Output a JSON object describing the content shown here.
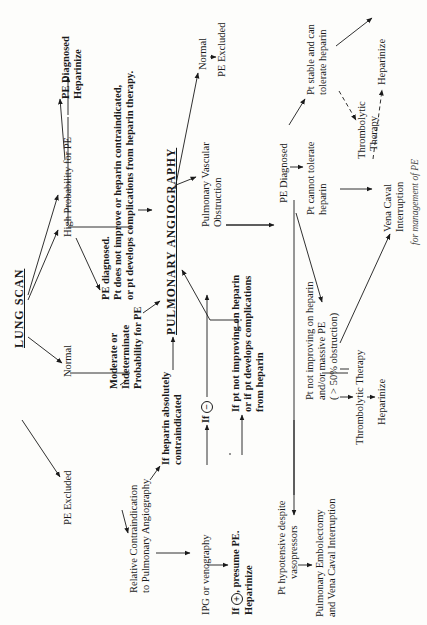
{
  "diagram": {
    "title": "LUNG SCAN",
    "caption": "for management of PE",
    "nodes": {
      "lung_scan": "LUNG SCAN",
      "normal_scan": "Normal",
      "pe_excluded_1": "PE Excluded",
      "moderate": [
        "Moderate or",
        "Indeterminate",
        "Probability for PE"
      ],
      "high_prob": "High Probability for PE",
      "pe_diag_heparinize": [
        "PE Diagnosed",
        "Heparinize"
      ],
      "pe_diag_notimprove": [
        "PE diagnosed.",
        "Pt does not improve or heparin contraindicated,",
        "or pt develops complications from heparin therapy."
      ],
      "pulm_angiography": "PULMONARY ANGIOGRAPHY",
      "rel_contra": [
        "Relative Contraindication",
        "to Pulmonary Angiography"
      ],
      "heparin_abs": [
        "If heparin absolutely",
        "contraindicated"
      ],
      "ipg": "IPG or venography",
      "if_negative": "If",
      "negative_sign": "−",
      "if_positive_prefix": "If",
      "positive_sign": "+",
      "if_positive_rest": ", presume PE.",
      "heparinize_1": "Heparinize",
      "not_improving_hep": [
        "If  pt not improving on heparin",
        "or if pt develops complications",
        "from heparin"
      ],
      "normal_angio": "Normal",
      "pe_excluded_2": "PE Excluded",
      "pulm_vasc_obs": [
        "Pulmonary Vascular",
        "Obstruction"
      ],
      "pe_diagnosed": "PE Diagnosed",
      "pt_stable": [
        "Pt stable and can",
        "tolerate heparin"
      ],
      "heparinize_2": "Heparinize",
      "thrombolytic_1": [
        "Thrombolytic",
        "Therapy"
      ],
      "pt_cannot": [
        "Pt cannot tolerate",
        "heparin"
      ],
      "vena_caval": [
        "Vena Caval",
        "Interruption"
      ],
      "pt_not_improving": [
        "Pt not improving on  heparin",
        "and/or massive PE",
        "( > 50% obstruction)"
      ],
      "thrombolytic_2": "Thrombolytic  Therapy",
      "heparinize_3": "Heparinize",
      "pt_hypotensive": [
        "Pt hypotensive despite",
        "vasopressors"
      ],
      "embolectomy": [
        "Pulmonary Embolectomy",
        "and Vena Caval Interruption"
      ]
    },
    "edges": [
      {
        "from": "lung_scan",
        "to": "normal_scan"
      },
      {
        "from": "normal_scan",
        "to": "pe_excluded_1"
      },
      {
        "from": "lung_scan",
        "to": "moderate"
      },
      {
        "from": "lung_scan",
        "to": "high_prob"
      },
      {
        "from": "high_prob",
        "to": "pe_diag_heparinize"
      },
      {
        "from": "high_prob",
        "to": "pe_diag_notimprove"
      },
      {
        "from": "pe_diag_notimprove",
        "to": "pulm_angiography"
      },
      {
        "from": "moderate",
        "to": "pulm_angiography"
      },
      {
        "from": "moderate",
        "to": "rel_contra"
      },
      {
        "from": "rel_contra",
        "to": "heparin_abs"
      },
      {
        "from": "heparin_abs",
        "to": "pulm_angiography"
      },
      {
        "from": "rel_contra",
        "to": "ipg"
      },
      {
        "from": "ipg",
        "to": "if_negative"
      },
      {
        "from": "if_negative",
        "to": "pulm_angiography"
      },
      {
        "from": "ipg",
        "to": "if_positive"
      },
      {
        "from": "if_positive",
        "to": "not_improving_hep"
      },
      {
        "from": "not_improving_hep",
        "to": "pulm_angiography"
      },
      {
        "from": "pulm_angiography",
        "to": "normal_angio"
      },
      {
        "from": "normal_angio",
        "to": "pe_excluded_2"
      },
      {
        "from": "pulm_angiography",
        "to": "pulm_vasc_obs"
      },
      {
        "from": "pulm_vasc_obs",
        "to": "pe_diagnosed"
      },
      {
        "from": "pe_diagnosed",
        "to": "pt_stable"
      },
      {
        "from": "pt_stable",
        "to": "heparinize_2"
      },
      {
        "from": "pt_stable",
        "to": "thrombolytic_1",
        "style": "dashed"
      },
      {
        "from": "thrombolytic_1",
        "to": "heparinize_2",
        "style": "dashed"
      },
      {
        "from": "pe_diagnosed",
        "to": "pt_cannot"
      },
      {
        "from": "pt_cannot",
        "to": "vena_caval"
      },
      {
        "from": "pe_diagnosed",
        "to": "pt_not_improving"
      },
      {
        "from": "pt_not_improving",
        "to": "vena_caval"
      },
      {
        "from": "pt_not_improving",
        "to": "thrombolytic_2"
      },
      {
        "from": "thrombolytic_2",
        "to": "heparinize_3"
      },
      {
        "from": "pe_diagnosed",
        "to": "pt_hypotensive"
      },
      {
        "from": "pt_hypotensive",
        "to": "embolectomy"
      }
    ]
  }
}
